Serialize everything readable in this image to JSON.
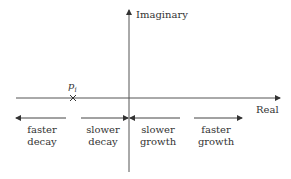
{
  "axes": {
    "imaginary_label": "Imaginary",
    "real_label": "Real"
  },
  "pole": {
    "symbol": "p",
    "subscript": "i",
    "marker": "×"
  },
  "regions": [
    {
      "id": "faster-decay",
      "line1": "faster",
      "line2": "decay",
      "direction": "left"
    },
    {
      "id": "slower-decay",
      "line1": "slower",
      "line2": "decay",
      "direction": "right"
    },
    {
      "id": "slower-growth",
      "line1": "slower",
      "line2": "growth",
      "direction": "left"
    },
    {
      "id": "faster-growth",
      "line1": "faster",
      "line2": "growth",
      "direction": "right"
    }
  ],
  "colors": {
    "line": "#333333",
    "text": "#333333"
  }
}
